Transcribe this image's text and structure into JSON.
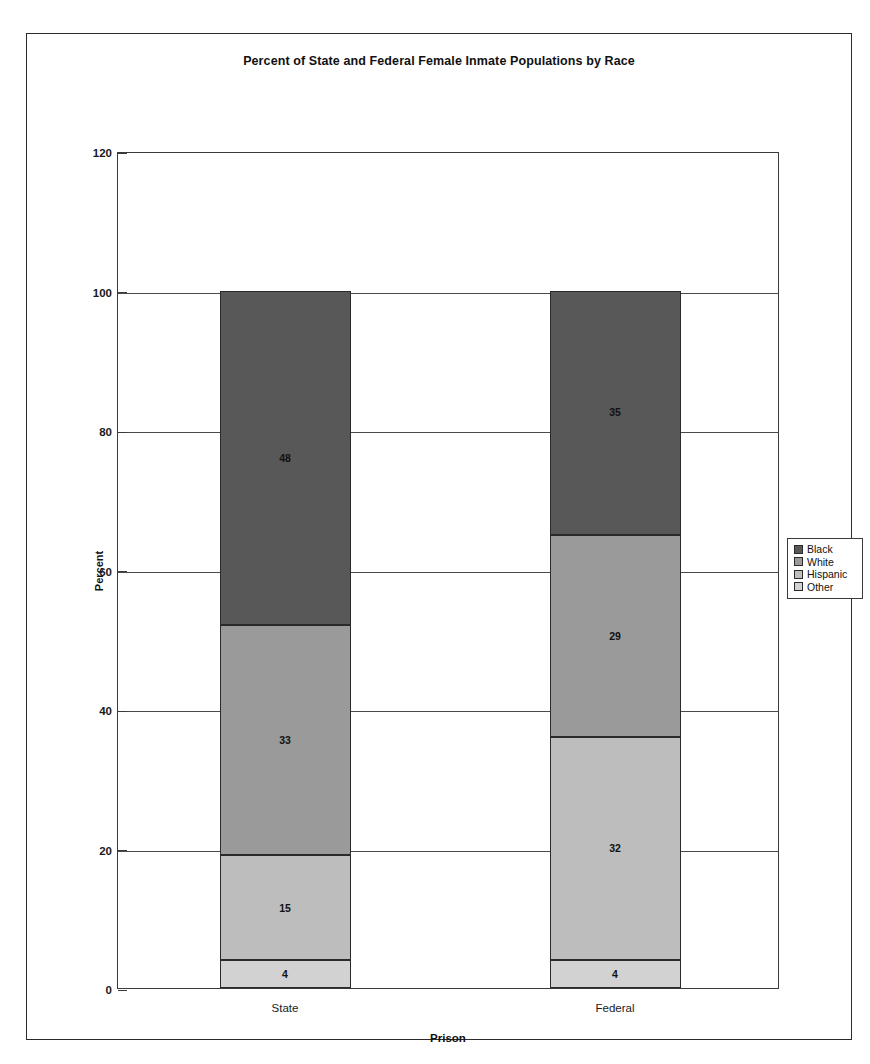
{
  "figure": {
    "title": "Percent of State and Federal Female Inmate Populations by Race"
  },
  "chart_data": {
    "type": "bar",
    "stacked": true,
    "title": "Percent of State and Federal Female Inmate Populations by Race",
    "xlabel": "Prison",
    "ylabel": "Percent",
    "categories": [
      "State",
      "Federal"
    ],
    "ylim": [
      0,
      120
    ],
    "yticks": [
      0,
      20,
      40,
      60,
      80,
      100,
      120
    ],
    "ytick_labels": [
      "0",
      "20",
      "40",
      "60",
      "80",
      "100",
      "120"
    ],
    "grid": true,
    "legend_position": "right",
    "stack_order_bottom_to_top": [
      "Other",
      "Hispanic",
      "White",
      "Black"
    ],
    "series": [
      {
        "name": "Black",
        "values": [
          48,
          35
        ],
        "color": "#585858"
      },
      {
        "name": "White",
        "values": [
          33,
          29
        ],
        "color": "#9a9a9a"
      },
      {
        "name": "Hispanic",
        "values": [
          15,
          32
        ],
        "color": "#bdbdbd"
      },
      {
        "name": "Other",
        "values": [
          4,
          4
        ],
        "color": "#d2d2d2"
      }
    ],
    "totals": [
      100,
      100
    ],
    "data_labels": {
      "State": {
        "Black": "48",
        "White": "33",
        "Hispanic": "15",
        "Other": "4"
      },
      "Federal": {
        "Black": "35",
        "White": "29",
        "Hispanic": "32",
        "Other": "4"
      }
    }
  },
  "legend": {
    "items": [
      {
        "label": "Black",
        "color": "#585858"
      },
      {
        "label": "White",
        "color": "#9a9a9a"
      },
      {
        "label": "Hispanic",
        "color": "#bdbdbd"
      },
      {
        "label": "Other",
        "color": "#d2d2d2"
      }
    ]
  }
}
